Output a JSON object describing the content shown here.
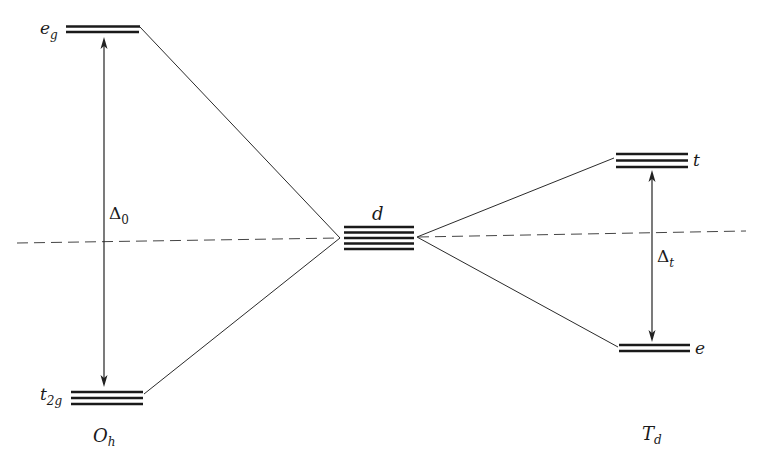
{
  "diagram": {
    "type": "crystal-field-splitting",
    "colors": {
      "ink": "#1a1a1a",
      "background": "#ffffff"
    },
    "levels": {
      "eg": {
        "label": "e",
        "subscript": "g",
        "lines": 2
      },
      "t2g": {
        "label": "t",
        "subscript": "2g",
        "lines": 3
      },
      "d": {
        "label": "d",
        "lines": 5
      },
      "t": {
        "label": "t",
        "lines": 3
      },
      "e": {
        "label": "e",
        "lines": 2
      }
    },
    "splittings": {
      "octahedral": {
        "symbol": "Δ",
        "subscript": "0"
      },
      "tetrahedral": {
        "symbol": "Δ",
        "subscript": "t"
      }
    },
    "geometries": {
      "octahedral": {
        "label": "O",
        "subscript": "h"
      },
      "tetrahedral": {
        "label": "T",
        "subscript": "d"
      }
    }
  }
}
